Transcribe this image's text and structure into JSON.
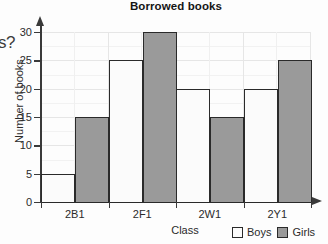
{
  "fragments": {
    "top_clip": "¯",
    "left_clip": "s?"
  },
  "chart_data": {
    "type": "bar",
    "title": "Borrowed books",
    "xlabel": "Class",
    "ylabel": "Number of books",
    "categories": [
      "2B1",
      "2F1",
      "2W1",
      "2Y1"
    ],
    "series": [
      {
        "name": "Boys",
        "color": "#fbfbfb",
        "values": [
          5,
          25,
          20,
          20
        ]
      },
      {
        "name": "Girls",
        "color": "#9a9a9a",
        "values": [
          15,
          30,
          15,
          25
        ]
      }
    ],
    "ylim": [
      0,
      30
    ],
    "ytick_labels": [
      "0",
      "5",
      "10",
      "15",
      "20",
      "25",
      "30"
    ],
    "ytick_values": [
      0,
      5,
      10,
      15,
      20,
      25,
      30
    ],
    "grid": true,
    "legend_position": "bottom-right",
    "axis_arrows": true
  },
  "legend": {
    "boys_label": "Boys",
    "girls_label": "Girls"
  }
}
